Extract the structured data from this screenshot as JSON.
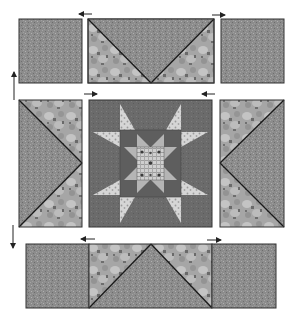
{
  "diagram": {
    "title": "Quilt block assembly diagram",
    "colors": {
      "background_fabric": "#8c8c8c",
      "background_fabric_dark": "#6e6e6e",
      "print_fabric": "#a8a8a8",
      "print_fabric_light": "#c6c6c6",
      "print_fabric_spot": "#6a6a6a",
      "star_bg": "#6b6b6b",
      "star_points_light": "#d4d4d4",
      "inner_star_points": "#b5b5b5",
      "center_check": "#cfcfcf",
      "seam_line": "#1a1a1a",
      "arrow": "#222222"
    },
    "rows": [
      {
        "name": "top-row",
        "units": [
          {
            "name": "corner-square-top-left",
            "type": "square"
          },
          {
            "name": "flying-geese-top",
            "type": "flying-geese",
            "orientation": "point-down"
          },
          {
            "name": "corner-square-top-right",
            "type": "square"
          }
        ],
        "arrows": [
          {
            "name": "press-arrow-top-left",
            "direction": "left"
          },
          {
            "name": "press-arrow-top-right",
            "direction": "right"
          }
        ]
      },
      {
        "name": "middle-row",
        "units": [
          {
            "name": "flying-geese-left",
            "type": "flying-geese",
            "orientation": "point-right"
          },
          {
            "name": "center-star-block",
            "type": "sawtooth-star-within-star"
          },
          {
            "name": "flying-geese-right",
            "type": "flying-geese",
            "orientation": "point-left"
          }
        ],
        "arrows": [
          {
            "name": "press-arrow-middle-left",
            "direction": "right"
          },
          {
            "name": "press-arrow-middle-right",
            "direction": "left"
          }
        ]
      },
      {
        "name": "bottom-row",
        "units": [
          {
            "name": "corner-square-bottom-left",
            "type": "square"
          },
          {
            "name": "flying-geese-bottom",
            "type": "flying-geese",
            "orientation": "point-up"
          },
          {
            "name": "corner-square-bottom-right",
            "type": "square"
          }
        ],
        "arrows": [
          {
            "name": "press-arrow-bottom-left",
            "direction": "left"
          },
          {
            "name": "press-arrow-bottom-right",
            "direction": "right"
          }
        ]
      }
    ],
    "row_arrows": [
      {
        "name": "press-arrow-row-up",
        "direction": "up"
      },
      {
        "name": "press-arrow-row-down",
        "direction": "down"
      }
    ]
  }
}
